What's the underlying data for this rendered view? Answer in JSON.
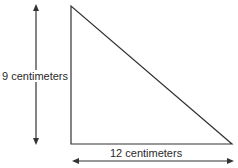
{
  "diagram": {
    "shape": "right triangle",
    "height_label": "9 centimeters",
    "base_label": "12 centimeters",
    "height_value": 9,
    "base_value": 12,
    "unit": "centimeters",
    "line_color": "#333333"
  }
}
